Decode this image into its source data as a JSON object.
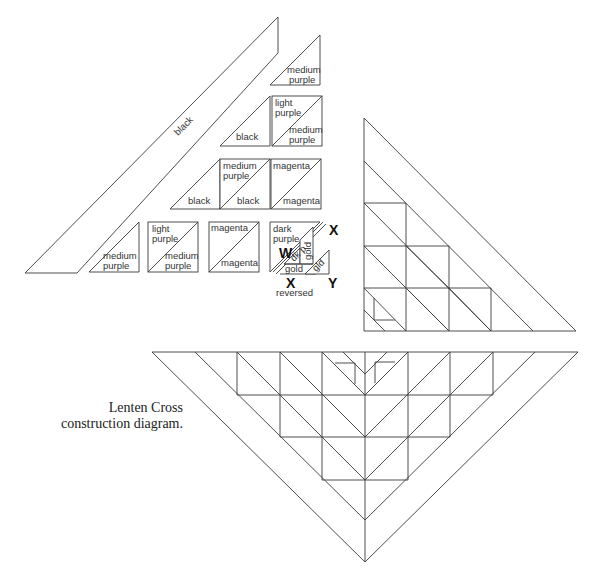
{
  "caption": {
    "line1": "Lenten Cross",
    "line2": "construction diagram."
  },
  "pieces": {
    "long_strip": "black",
    "top_small": [
      "medium",
      "purple"
    ],
    "row2_left": "black",
    "row2_right_top": [
      "light",
      "purple"
    ],
    "row2_right_bottom": [
      "medium",
      "purple"
    ],
    "row3_left": "black",
    "row3_mid_top": [
      "medium",
      "purple"
    ],
    "row3_mid_bottom": "black",
    "row3_right_top": "magenta",
    "row3_right_bottom": "magenta",
    "row4_a": [
      "medium",
      "purple"
    ],
    "row4_b_top": [
      "light",
      "purple"
    ],
    "row4_b_bottom": [
      "medium",
      "purple"
    ],
    "row4_c_top": "magenta",
    "row4_c_bottom": "magenta",
    "row4_d_top": [
      "dark",
      "purple"
    ],
    "row4_d_dkp": "dk p",
    "row4_d_gold_vert": "gold",
    "row4_d_gold_bottom": "gold",
    "row4_d_gld": "gld"
  },
  "unit_labels": {
    "W": "W",
    "X": "X",
    "X_reversed": "X",
    "reversed": "reversed",
    "Y": "Y"
  }
}
